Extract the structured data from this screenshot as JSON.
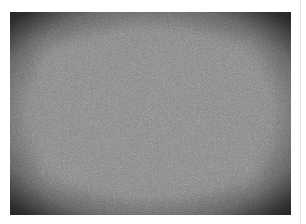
{
  "image": {
    "description": "grayscale noise texture with dark vignette border",
    "colors": {
      "border_dark": "#1e1e1e",
      "center_gray": "#858585",
      "page_background": "#ffffff",
      "side_line": "#e2e2e2"
    }
  }
}
